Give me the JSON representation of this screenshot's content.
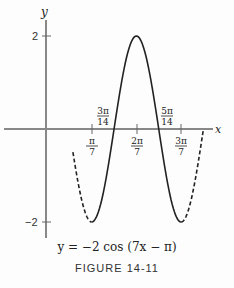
{
  "chart_data": {
    "type": "line",
    "title": "FIGURE 14-11",
    "equation": "y = −2 cos (7x − π)",
    "xlabel": "x",
    "ylabel": "y",
    "function": "y = -2*cos(7*x - pi)",
    "amplitude": 2,
    "period": "2π/7",
    "phase_shift": "π/7",
    "x_ticks": [
      {
        "value": "π/7",
        "num": "π",
        "den": "7",
        "pos": "below"
      },
      {
        "value": "2π/7",
        "num": "2π",
        "den": "7",
        "pos": "below"
      },
      {
        "value": "3π/7",
        "num": "3π",
        "den": "7",
        "pos": "below"
      }
    ],
    "x_annotations": [
      {
        "value": "3π/14",
        "num": "3π",
        "den": "14",
        "note": "zero crossing"
      },
      {
        "value": "5π/14",
        "num": "5π",
        "den": "14",
        "note": "zero crossing"
      }
    ],
    "y_ticks": [
      {
        "value": 2,
        "label": "2"
      },
      {
        "value": -2,
        "label": "−2"
      }
    ],
    "key_points": [
      {
        "x": "π/7",
        "y": -2,
        "label": "minimum"
      },
      {
        "x": "3π/14",
        "y": 0
      },
      {
        "x": "2π/7",
        "y": 2,
        "label": "maximum"
      },
      {
        "x": "5π/14",
        "y": 0
      },
      {
        "x": "3π/7",
        "y": -2,
        "label": "minimum"
      }
    ],
    "solid_range": [
      "π/7",
      "3π/7"
    ],
    "dashed_extensions": [
      [
        "≈0.59π/7",
        "π/7"
      ],
      [
        "3π/7",
        "≈3.5π/7"
      ]
    ],
    "ylim": [
      -2,
      2
    ],
    "grid": false
  },
  "labels": {
    "y_axis": "y",
    "x_axis": "x",
    "y_tick_top": "2",
    "y_tick_bottom": "−2",
    "formula": "y = −2 cos (7x − π)",
    "figure": "FIGURE 14-11"
  }
}
